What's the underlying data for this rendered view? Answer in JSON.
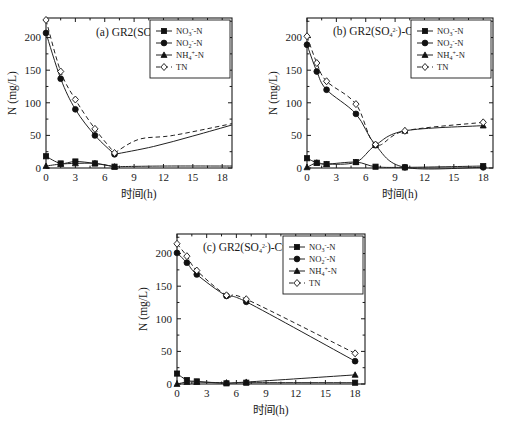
{
  "figure": {
    "panel_count": 3,
    "axis": {
      "ylabel": "N (mg/L)",
      "xlabel": "时间(h)",
      "ylim": [
        0,
        230
      ],
      "yticks": [
        0,
        50,
        100,
        150,
        200
      ],
      "ytick_labels": [
        "0",
        "50",
        "100",
        "150",
        "200"
      ],
      "xlim": [
        0,
        19
      ],
      "xticks": [
        0,
        3,
        6,
        9,
        12,
        15,
        18
      ],
      "xtick_labels": [
        "0",
        "3",
        "6",
        "9",
        "12",
        "15",
        "18"
      ]
    },
    "legend": {
      "entries": [
        {
          "key": "no3",
          "marker": "filled-square",
          "line": "solid",
          "base": "NO",
          "sub": "3",
          "sup": "-",
          "tail": "-N"
        },
        {
          "key": "no2",
          "marker": "filled-circle",
          "line": "solid",
          "base": "NO",
          "sub": "2",
          "sup": "-",
          "tail": "-N"
        },
        {
          "key": "nh4",
          "marker": "filled-triangle",
          "line": "solid",
          "base": "NH",
          "sub": "4",
          "sup": "+",
          "tail": "-N"
        },
        {
          "key": "tn",
          "marker": "open-diamond",
          "line": "dashed",
          "base": "TN",
          "sub": "",
          "sup": "",
          "tail": ""
        }
      ]
    }
  },
  "chart_data": [
    {
      "id": "panel-a",
      "type": "line",
      "title": {
        "label": "(a) GR2(SO",
        "sub": "4",
        "sup": "2-",
        "tail": ")"
      },
      "title_plain": "(a) GR2(SO4 2-)",
      "xlabel": "时间(h)",
      "ylabel": "N (mg/L)",
      "xlim": [
        0,
        19
      ],
      "ylim": [
        0,
        230
      ],
      "grid": false,
      "legend_position": "top-right",
      "series": [
        {
          "name": "NO3-N",
          "marker": "filled-square",
          "line": "solid",
          "x": [
            0,
            1.5,
            3,
            5,
            7
          ],
          "values": [
            18,
            7,
            10,
            7,
            2
          ]
        },
        {
          "name": "NO2-N",
          "marker": "filled-circle",
          "line": "solid",
          "x": [
            0,
            1.5,
            3,
            5,
            7
          ],
          "values": [
            207,
            137,
            90,
            50,
            21
          ]
        },
        {
          "name": "NH4-N",
          "marker": "filled-triangle",
          "line": "solid",
          "x": [
            0,
            1.5,
            3,
            5,
            7
          ],
          "values": [
            3,
            6,
            7,
            7,
            2
          ]
        },
        {
          "name": "TN",
          "marker": "open-diamond",
          "line": "dashed",
          "x": [
            0,
            1.5,
            3,
            5,
            7
          ],
          "values": [
            227,
            148,
            105,
            60,
            23
          ]
        }
      ],
      "extrapolated": {
        "note": "two unmarked trend curves continue past 7 h toward ~65 mg/L at 19 h",
        "rising_solid_end": 66,
        "rising_dashed_min": 44,
        "rising_dashed_end": 68
      }
    },
    {
      "id": "panel-b",
      "type": "line",
      "title": {
        "label": "(b) GR2(SO",
        "sub": "4",
        "sup": "2-",
        "tail": ")-Cu"
      },
      "title_plain": "(b) GR2(SO4 2-)-Cu",
      "xlabel": "时间(h)",
      "ylabel": "N (mg/L)",
      "xlim": [
        0,
        19
      ],
      "ylim": [
        0,
        230
      ],
      "grid": false,
      "legend_position": "top-right",
      "series": [
        {
          "name": "NO3-N",
          "marker": "filled-square",
          "line": "solid",
          "x": [
            0,
            1,
            2,
            5,
            7,
            10,
            18
          ],
          "values": [
            15,
            8,
            6,
            9,
            2,
            1,
            3
          ]
        },
        {
          "name": "NO2-N",
          "marker": "filled-circle",
          "line": "solid",
          "x": [
            0,
            1,
            2,
            5,
            7,
            10,
            18
          ],
          "values": [
            189,
            148,
            120,
            83,
            35,
            1,
            1
          ]
        },
        {
          "name": "NH4-N",
          "marker": "filled-triangle",
          "line": "solid",
          "x": [
            0,
            1,
            2,
            5,
            7,
            10,
            18
          ],
          "values": [
            1,
            8,
            6,
            9,
            35,
            57,
            65
          ]
        },
        {
          "name": "TN",
          "marker": "open-diamond",
          "line": "dashed",
          "x": [
            0,
            1,
            2,
            5,
            7,
            10,
            18
          ],
          "values": [
            202,
            161,
            133,
            98,
            36,
            57,
            70
          ]
        }
      ]
    },
    {
      "id": "panel-c",
      "type": "line",
      "title": {
        "label": "(c) GR2(SO",
        "sub": "4",
        "sup": "2-",
        "tail": ")-CuAl"
      },
      "title_plain": "(c) GR2(SO4 2-)-CuAl",
      "xlabel": "时间(h)",
      "ylabel": "N (mg/L)",
      "xlim": [
        0,
        19
      ],
      "ylim": [
        0,
        230
      ],
      "grid": false,
      "legend_position": "top-right",
      "series": [
        {
          "name": "NO3-N",
          "marker": "filled-square",
          "line": "solid",
          "x": [
            0,
            1,
            2,
            5,
            7,
            18
          ],
          "values": [
            16,
            6,
            4,
            1,
            2,
            2
          ]
        },
        {
          "name": "NO2-N",
          "marker": "filled-circle",
          "line": "solid",
          "x": [
            0,
            1,
            2,
            5,
            7,
            18
          ],
          "values": [
            201,
            186,
            168,
            135,
            126,
            35
          ]
        },
        {
          "name": "NH4-N",
          "marker": "filled-triangle",
          "line": "solid",
          "x": [
            0,
            1,
            2,
            5,
            7,
            18
          ],
          "values": [
            0,
            3,
            3,
            2,
            3,
            14
          ]
        },
        {
          "name": "TN",
          "marker": "open-diamond",
          "line": "dashed",
          "x": [
            0,
            1,
            2,
            5,
            7,
            18
          ],
          "values": [
            215,
            196,
            174,
            136,
            130,
            47
          ]
        }
      ]
    }
  ]
}
